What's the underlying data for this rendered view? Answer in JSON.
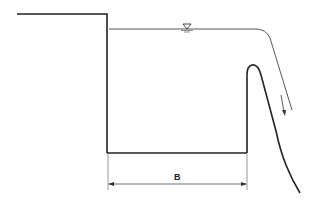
{
  "diagram": {
    "labels": {
      "width_dimension": "B"
    },
    "symbols": {
      "water_surface": "water-level-triangle",
      "flow_direction": "downward-arrow"
    },
    "colors": {
      "line": "#222222",
      "background": "#ffffff"
    }
  }
}
